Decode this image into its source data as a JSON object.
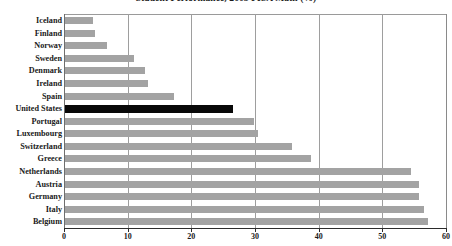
{
  "chart_data": {
    "type": "bar",
    "orientation": "horizontal",
    "title": "Student Performance, 2003 PISA Math (%)",
    "xlabel": "",
    "ylabel": "",
    "xlim": [
      0,
      60
    ],
    "xticks": [
      0,
      10,
      20,
      30,
      40,
      50,
      60
    ],
    "xtick_labels": [
      "0",
      "10",
      "20",
      "30",
      "40",
      "50",
      "60"
    ],
    "grid": "vertical",
    "legend": "none",
    "bar_color": "#a3a3a3",
    "highlight_color": "#080808",
    "highlight_category": "United States",
    "categories": [
      "Iceland",
      "Finland",
      "Norway",
      "Sweden",
      "Denmark",
      "Ireland",
      "Spain",
      "United States",
      "Portugal",
      "Luxembourg",
      "Switzerland",
      "Greece",
      "Netherlands",
      "Austria",
      "Germany",
      "Italy",
      "Belgium"
    ],
    "values": [
      4.5,
      4.8,
      6.8,
      11.0,
      12.8,
      13.2,
      17.2,
      26.6,
      29.8,
      30.5,
      35.8,
      38.8,
      54.5,
      55.8,
      55.8,
      56.6,
      57.2
    ]
  }
}
